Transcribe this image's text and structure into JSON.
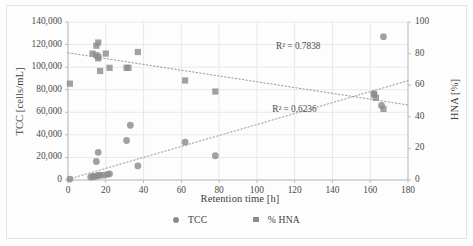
{
  "chart_data": {
    "type": "scatter",
    "title": "",
    "xlabel": "Retention time [h]",
    "ylabel": "TCC [cells/mL]",
    "y2label": "HNA [%]",
    "xlim": [
      0,
      180
    ],
    "ylim": [
      0,
      140000
    ],
    "y2lim": [
      0,
      100
    ],
    "grid": true,
    "legend_position": "bottom",
    "xticks": [
      "0",
      "20",
      "40",
      "60",
      "80",
      "100",
      "120",
      "140",
      "160",
      "180"
    ],
    "xtick_values": [
      0,
      20,
      40,
      60,
      80,
      100,
      120,
      140,
      160,
      180
    ],
    "yticks": [
      "0",
      "20,000",
      "40,000",
      "60,000",
      "80,000",
      "100,000",
      "120,000",
      "140,000"
    ],
    "ytick_values": [
      0,
      20000,
      40000,
      60000,
      80000,
      100000,
      120000,
      140000
    ],
    "y2ticks": [
      "0",
      "20",
      "40",
      "60",
      "80",
      "100"
    ],
    "y2tick_values": [
      0,
      20,
      40,
      60,
      80,
      100
    ],
    "marker_color": "#8c8c8c",
    "trendline_color": "#9a9a9a",
    "gridline_color": "#e8e8e8",
    "axis_color": "#bdbdbd",
    "series": [
      {
        "name": "TCC",
        "axis": "left",
        "marker": "circle",
        "points": [
          [
            1,
            800
          ],
          [
            12,
            2600
          ],
          [
            13,
            3200
          ],
          [
            14,
            3000
          ],
          [
            15,
            3500
          ],
          [
            15,
            16500
          ],
          [
            16,
            24500
          ],
          [
            16,
            4000
          ],
          [
            17,
            4200
          ],
          [
            19,
            4300
          ],
          [
            21,
            5000
          ],
          [
            22,
            5500
          ],
          [
            31,
            35000
          ],
          [
            33,
            48500
          ],
          [
            37,
            12500
          ],
          [
            62,
            33500
          ],
          [
            78,
            21500
          ],
          [
            162,
            76500
          ],
          [
            166,
            66000
          ],
          [
            167,
            127000
          ]
        ]
      },
      {
        "name": "% HNA",
        "axis": "right",
        "marker": "square",
        "points": [
          [
            1,
            61
          ],
          [
            13,
            80
          ],
          [
            15,
            85
          ],
          [
            16,
            87
          ],
          [
            15,
            79
          ],
          [
            16,
            77
          ],
          [
            16,
            78
          ],
          [
            17,
            69
          ],
          [
            20,
            80
          ],
          [
            22,
            71
          ],
          [
            31,
            71
          ],
          [
            32,
            71
          ],
          [
            37,
            81
          ],
          [
            62,
            63
          ],
          [
            78,
            56
          ],
          [
            162,
            54
          ],
          [
            163,
            52
          ],
          [
            167,
            45
          ]
        ]
      }
    ],
    "trendlines": [
      {
        "name": "TCC trend",
        "axis": "left",
        "r2_label": "R² = 0.7838",
        "r2_value": 0.7838,
        "x_start": 0,
        "y_start": 600,
        "x_end": 180,
        "y_end": 88000,
        "label_x": 126,
        "label_y": 117500
      },
      {
        "name": "% HNA trend",
        "axis": "right",
        "r2_label": "R² = 0.6236",
        "r2_value": 0.6236,
        "x_start": 0,
        "y_start": 80.5,
        "x_end": 180,
        "y_end": 47.5,
        "label_x": 124,
        "label_y": 44.5
      }
    ]
  },
  "legend": {
    "entries": [
      {
        "label": "TCC",
        "marker": "circle"
      },
      {
        "label": "% HNA",
        "marker": "square"
      }
    ]
  }
}
